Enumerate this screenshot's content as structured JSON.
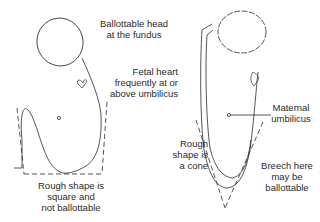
{
  "figures": {
    "left": {
      "title": "Cephalic-type upright outline",
      "labels": {
        "head": "Ballottable head\nat the fundus",
        "heart": "Fetal heart\nfrequently at or\nabove umbilicus",
        "shape": "Rough shape is\nsquare and\nnot ballottable"
      }
    },
    "right": {
      "labels": {
        "shape": "Rough\nshape is\na cone",
        "umbilicus": "Maternal\numbilicus",
        "breech": "Breech here\nmay be\nballottable"
      }
    }
  },
  "colors": {
    "line": "#2a2a2a",
    "background": "#ffffff"
  }
}
